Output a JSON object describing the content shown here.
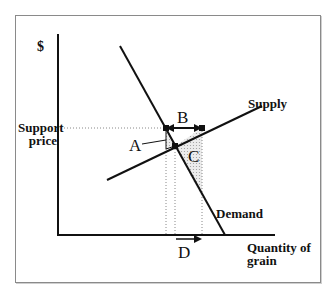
{
  "diagram": {
    "axes": {
      "y_label": "$",
      "x_label_line1": "Quantity of",
      "x_label_line2": "grain"
    },
    "curves": {
      "supply": "Supply",
      "demand": "Demand"
    },
    "price_level": {
      "label_line1": "Support",
      "label_line2": "price"
    },
    "regions": {
      "a": "A",
      "b": "B",
      "c": "C",
      "d": "D"
    },
    "colors": {
      "line": "#111111",
      "shade": "#d8d8d8",
      "dotted": "#888888",
      "frame": "#8a8a8a"
    }
  }
}
